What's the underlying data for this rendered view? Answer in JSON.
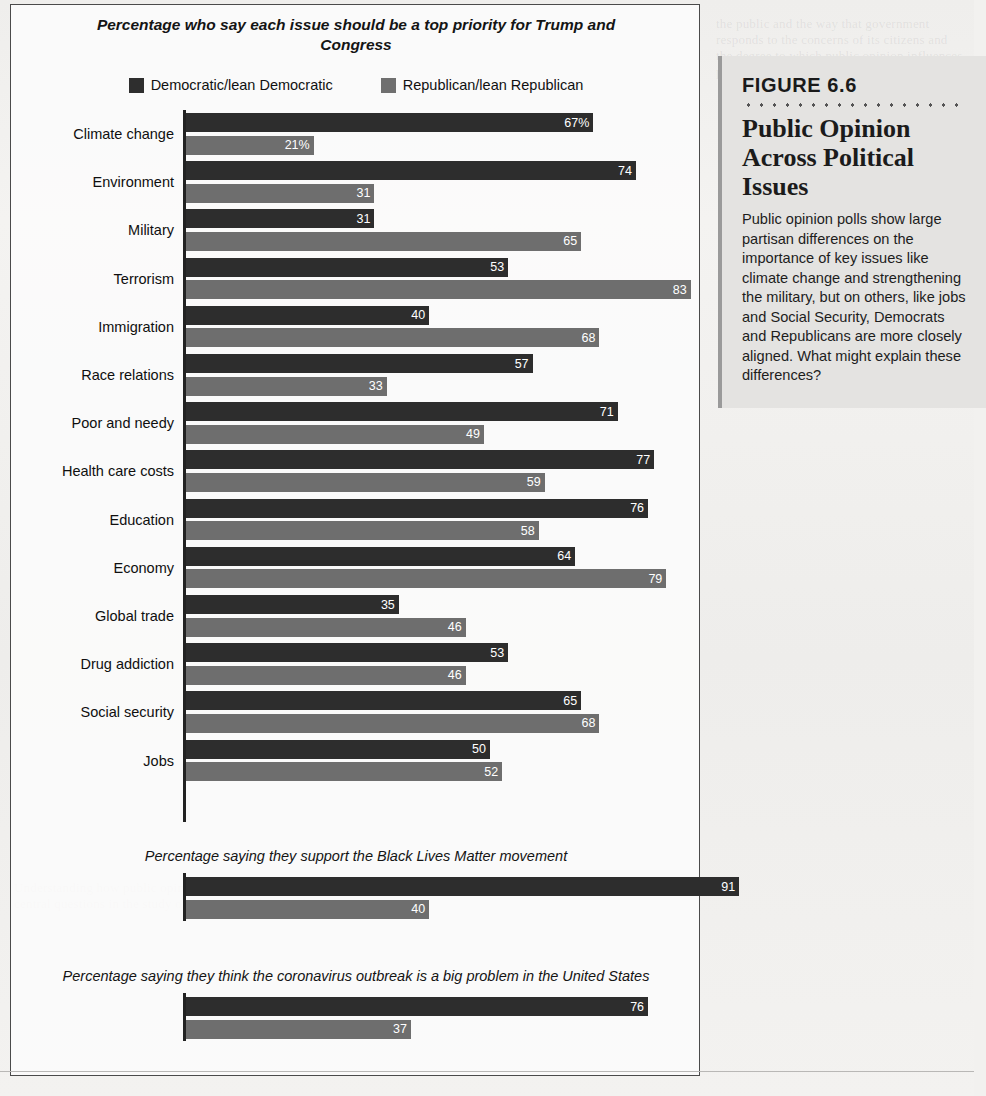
{
  "figure": {
    "number": "FIGURE 6.6",
    "title": "Public Opinion Across Political Issues",
    "body": "Public opinion polls show large partisan differences on the importance of key issues like climate change and strengthening the military, but on others, like jobs and Social Security, Democrats and Republicans are more closely aligned. What might explain these differences?"
  },
  "legend": {
    "items": [
      {
        "label": "Democratic/lean Democratic",
        "color": "#2d2d2d",
        "key": "dem"
      },
      {
        "label": "Republican/lean Republican",
        "color": "#6e6e6e",
        "key": "rep"
      }
    ]
  },
  "chart_data": [
    {
      "type": "bar",
      "orientation": "horizontal",
      "title": "Percentage who say each issue should be a top priority for Trump and Congress",
      "xlabel": "",
      "ylabel": "",
      "xlim": [
        0,
        85
      ],
      "grid": false,
      "legend_position": "top-center",
      "categories": [
        "Climate change",
        "Environment",
        "Military",
        "Terrorism",
        "Immigration",
        "Race relations",
        "Poor and needy",
        "Health care costs",
        "Education",
        "Economy",
        "Global trade",
        "Drug addiction",
        "Social security",
        "Jobs"
      ],
      "series": [
        {
          "name": "Democratic/lean Democratic",
          "values": [
            67,
            74,
            31,
            53,
            40,
            57,
            71,
            77,
            76,
            64,
            35,
            53,
            65,
            50
          ],
          "labels": [
            "67%",
            "74",
            "31",
            "53",
            "40",
            "57",
            "71",
            "77",
            "76",
            "64",
            "35",
            "53",
            "65",
            "50"
          ]
        },
        {
          "name": "Republican/lean Republican",
          "values": [
            21,
            31,
            65,
            83,
            68,
            33,
            49,
            59,
            58,
            79,
            46,
            46,
            68,
            52
          ],
          "labels": [
            "21%",
            "31",
            "65",
            "83",
            "68",
            "33",
            "49",
            "59",
            "58",
            "79",
            "46",
            "46",
            "68",
            "52"
          ]
        }
      ]
    },
    {
      "type": "bar",
      "orientation": "horizontal",
      "title": "Percentage saying they support the Black Lives Matter movement",
      "xlim": [
        0,
        85
      ],
      "categories": [
        ""
      ],
      "series": [
        {
          "name": "Democratic/lean Democratic",
          "values": [
            91
          ],
          "labels": [
            "91"
          ]
        },
        {
          "name": "Republican/lean Republican",
          "values": [
            40
          ],
          "labels": [
            "40"
          ]
        }
      ]
    },
    {
      "type": "bar",
      "orientation": "horizontal",
      "title": "Percentage saying they think the coronavirus outbreak is a big problem in the United States",
      "xlim": [
        0,
        85
      ],
      "categories": [
        ""
      ],
      "series": [
        {
          "name": "Democratic/lean Democratic",
          "values": [
            76
          ],
          "labels": [
            "76"
          ]
        },
        {
          "name": "Republican/lean Republican",
          "values": [
            37
          ],
          "labels": [
            "37"
          ]
        }
      ]
    }
  ],
  "colors": {
    "democratic": "#2d2d2d",
    "republican": "#6e6e6e",
    "sidebar_bg": "#e4e3e1",
    "page_bg": "#f2f1ef"
  }
}
